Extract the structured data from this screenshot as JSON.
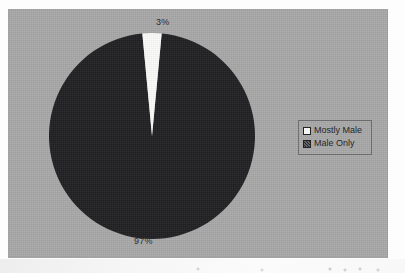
{
  "page": {
    "background_color": "#fdfdfd",
    "panel_color": "#a8a8a8"
  },
  "chart_data": {
    "type": "pie",
    "title": "",
    "subtitle": "",
    "xlabel": "",
    "ylabel": "",
    "categories": [
      "Mostly Male",
      "Male Only"
    ],
    "values": [
      3,
      97
    ],
    "value_unit": "%",
    "data_labels": [
      "3%",
      "97%"
    ],
    "slice_colors": [
      "#fbfbf9",
      "#1f1f22"
    ],
    "start_angle_deg": 0,
    "direction": "clockwise",
    "legend_position": "right",
    "grid": false,
    "slices": [
      {
        "name": "Mostly Male",
        "value": 3,
        "label": "3%",
        "color": "#fbfbf9",
        "label_position": "top"
      },
      {
        "name": "Male Only",
        "value": 97,
        "label": "97%",
        "color": "#1f1f22",
        "label_position": "bottom"
      }
    ]
  },
  "labels": {
    "mostly_male_pct": "3%",
    "male_only_pct": "97%"
  },
  "legend": {
    "entries": [
      {
        "label": "Mostly Male",
        "swatch": "white-square-swatch",
        "color": "#fbfbf9"
      },
      {
        "label": "Male Only",
        "swatch": "dark-hatched-square-swatch",
        "color": "#1f1f22"
      }
    ]
  }
}
